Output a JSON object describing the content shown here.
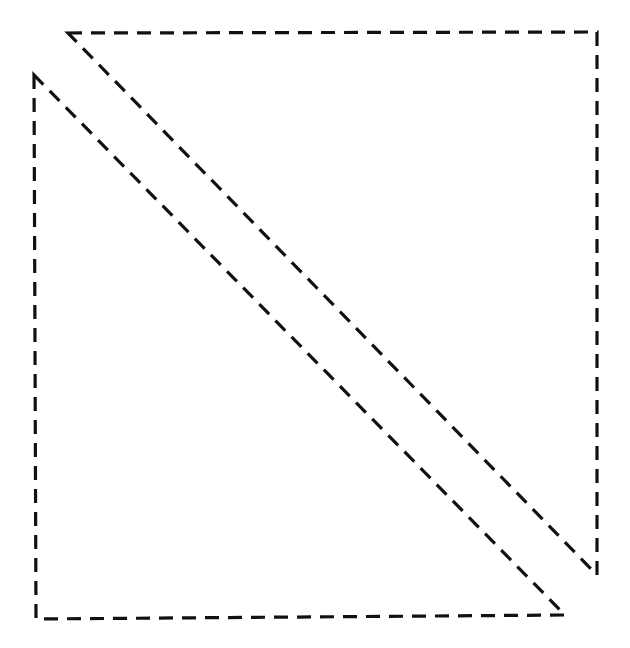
{
  "diagram": {
    "type": "geometric-shapes",
    "canvas": {
      "width": 630,
      "height": 648,
      "background": "#ffffff"
    },
    "stroke": {
      "color": "#111111",
      "width": 3.2,
      "dash": "14 9"
    },
    "shapes": [
      {
        "id": "upper-right-triangle",
        "kind": "right-triangle",
        "right_angle_at": "top-right",
        "points": [
          [
            68,
            33
          ],
          [
            597,
            32
          ],
          [
            597,
            575
          ]
        ]
      },
      {
        "id": "lower-left-triangle",
        "kind": "right-triangle",
        "right_angle_at": "bottom-left",
        "points": [
          [
            34,
            75
          ],
          [
            36,
            619
          ],
          [
            565,
            615
          ]
        ]
      }
    ]
  }
}
